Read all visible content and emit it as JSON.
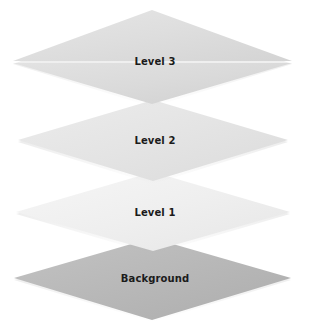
{
  "diagram": {
    "type": "layered-stack-diagram",
    "title": "",
    "background_color": "#ffffff",
    "label_color": "#1b1b1b",
    "layers": [
      {
        "id": "level-3",
        "label": "Level 3",
        "order": 4,
        "position_from_top": 1,
        "fill_color": "#dcdcdc",
        "fill_color_light": "#e8e8e8",
        "apex_y": 10,
        "mid_y": 61,
        "bottom_y": 104,
        "left_x": 13,
        "right_x": 292
      },
      {
        "id": "level-2",
        "label": "Level 2",
        "order": 3,
        "position_from_top": 2,
        "fill_color": "#e3e3e3",
        "fill_color_light": "#efefef",
        "apex_y": 100,
        "mid_y": 140,
        "bottom_y": 181,
        "left_x": 18,
        "right_x": 288
      },
      {
        "id": "level-1",
        "label": "Level 1",
        "order": 2,
        "position_from_top": 3,
        "fill_color": "#eeeeee",
        "fill_color_light": "#f7f7f7",
        "apex_y": 172,
        "mid_y": 212,
        "bottom_y": 251,
        "left_x": 16,
        "right_x": 290
      },
      {
        "id": "background",
        "label": "Background",
        "order": 1,
        "position_from_top": 4,
        "fill_color": "#b5b5b5",
        "fill_color_light": "#c2c2c2",
        "apex_y": 238,
        "mid_y": 278,
        "bottom_y": 322,
        "left_x": 14,
        "right_x": 291
      }
    ]
  }
}
